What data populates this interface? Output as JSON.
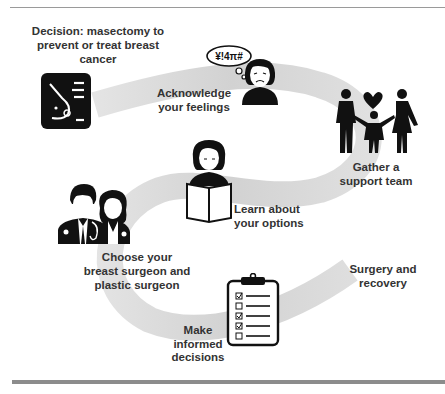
{
  "steps": [
    {
      "id": "decision",
      "label": "Decision: masectomy to\nprevent or treat breast\ncancer",
      "icon": "breast-profile-icon"
    },
    {
      "id": "feelings",
      "label": "Acknowledge\nyour feelings",
      "icon": "upset-woman-icon",
      "thought_bubble": "¥!4π#"
    },
    {
      "id": "support",
      "label": "Gather a\nsupport team",
      "icon": "family-heart-icon"
    },
    {
      "id": "learn",
      "label": "Learn about\nyour options",
      "icon": "woman-reading-book-icon"
    },
    {
      "id": "surgeons",
      "label": "Choose your\nbreast surgeon and\nplastic surgeon",
      "icon": "doctors-icon"
    },
    {
      "id": "decide",
      "label": "Make\ninformed\ndecisions",
      "icon": "clipboard-checklist-icon"
    },
    {
      "id": "surgery",
      "label": "Surgery and\nrecovery",
      "icon": ""
    }
  ],
  "checklist": [
    true,
    false,
    true,
    true,
    false
  ],
  "colors": {
    "ribbon": "#d9d9d9",
    "icon": "#111111",
    "text": "#333333",
    "rule": "#8c8c8c"
  }
}
